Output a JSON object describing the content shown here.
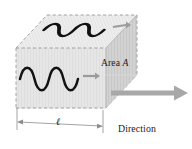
{
  "figure": {
    "background_color": "#ffffff",
    "width": 192,
    "height": 149
  },
  "labels": {
    "area_prefix": "Area ",
    "area_symbol": "A",
    "direction_line1": "Direction",
    "direction_line2": "of wave",
    "direction_line3": "propagation",
    "length_symbol": "ℓ"
  },
  "colors": {
    "wave_stroke": "#121212",
    "box_top_face": "#ececec",
    "box_front_face": "#e2e2e2",
    "box_right_face": "#cfcfcf",
    "box_bottom_face": "#f7f7f7",
    "edge_dashed": "#9a9a9a",
    "edge_solid": "#b4b4b4",
    "arrow_large": "#a8a8a8",
    "arrow_small": "#9b9b9b",
    "dimension_line": "#8d8d8d",
    "text": "#1b1b1b"
  },
  "geometry": {
    "box": {
      "front_top_left": [
        16,
        48
      ],
      "front_top_right": [
        106,
        48
      ],
      "front_bottom_left": [
        16,
        108
      ],
      "front_bottom_right": [
        106,
        108
      ],
      "back_top_left": [
        47,
        15
      ],
      "back_top_right": [
        137,
        15
      ],
      "back_bottom_right": [
        137,
        75
      ]
    },
    "dimension": {
      "y": 122,
      "x_start": 17,
      "x_end": 103
    },
    "large_arrow": {
      "from": [
        112,
        93
      ],
      "to": [
        186,
        93
      ]
    }
  },
  "elements": {
    "top_face_wave": "sine-wave-top",
    "front_face_wave": "sine-wave-front",
    "top_face_arrow": "small-arrow-top",
    "front_face_arrow": "small-arrow-front",
    "large_arrow": "propagation-arrow",
    "dimension": "length-dimension-line"
  }
}
